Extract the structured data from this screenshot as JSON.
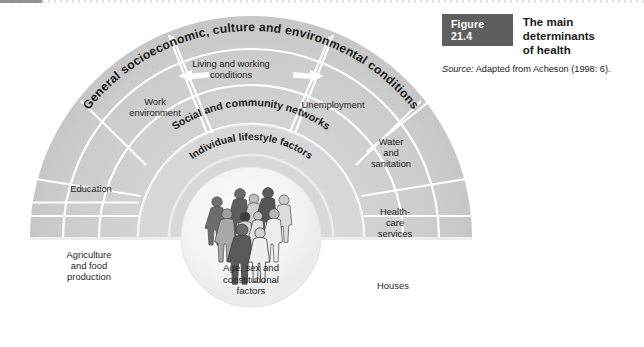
{
  "caption": {
    "figure_badge": "Figure 21.4",
    "title": "The main determinants\nof health",
    "source_prefix": "Source:",
    "source_text": " Adapted from Acheson (1998: 6)."
  },
  "diagram": {
    "type": "rainbow-model",
    "center": {
      "x": 251,
      "y": 237
    },
    "arc_labels": [
      {
        "key": "outer_ring",
        "text": "General socioeconomic, culture and environmental conditions",
        "radius": 206
      },
      {
        "key": "social_ring",
        "text": "Social and community networks",
        "radius": 131
      },
      {
        "key": "lifestyle_ring",
        "text": "Individual lifestyle factors",
        "radius": 97
      }
    ],
    "segments": [
      {
        "key": "living_working",
        "label": "Living and working\nconditions",
        "x": 231,
        "y": 72
      },
      {
        "key": "work_environment",
        "label": "Work\nenvironment",
        "x": 155,
        "y": 106
      },
      {
        "key": "unemployment",
        "label": "Unemployment",
        "x": 331,
        "y": 104
      },
      {
        "key": "education",
        "label": "Education",
        "x": 90,
        "y": 188
      },
      {
        "key": "water_sanitation",
        "label": "Water\nand\nsanitation",
        "x": 390,
        "y": 152
      },
      {
        "key": "agriculture_food",
        "label": "Agriculture\nand food\nproduction",
        "x": 88,
        "y": 265
      },
      {
        "key": "healthcare_services",
        "label": "Health-\ncare\nservices",
        "x": 394,
        "y": 222
      },
      {
        "key": "houses",
        "label": "Houses",
        "x": 392,
        "y": 286
      }
    ],
    "core": {
      "label": "Age, sex and\nconstitutional\nfactors",
      "x": 251,
      "y": 278,
      "illustration": "family-group-figures"
    },
    "arrows": [
      {
        "key": "arrow-left",
        "direction": "left"
      },
      {
        "key": "arrow-right",
        "direction": "right"
      }
    ],
    "colors": {
      "ring_fill": "#cfcfcf",
      "ring_fill_light": "#d9d9d9",
      "ring_divider": "#ffffff",
      "core_fill": "#f4f4f4",
      "badge_bg": "#5e5e5e",
      "text": "#1f1f1f",
      "page_bg": "#ffffff"
    }
  }
}
